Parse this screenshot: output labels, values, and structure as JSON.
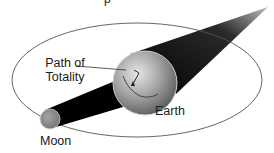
{
  "diagram": {
    "title_fragment": "p",
    "labels": {
      "path_of_totality": "Path of\nTotality",
      "path_line1": "Path of",
      "path_line2": "Totality",
      "earth": "Earth",
      "moon": "Moon"
    },
    "elements": {
      "orbit": {
        "shape": "ellipse",
        "cx": 137,
        "cy": 80,
        "rx": 125,
        "ry": 57,
        "stroke": "#555555"
      },
      "earth": {
        "shape": "sphere",
        "cx": 145,
        "cy": 83,
        "r": 32,
        "color": "#8a8a8a"
      },
      "moon": {
        "shape": "circle",
        "cx": 50,
        "cy": 119,
        "r": 10,
        "color": "#8c8c8c"
      },
      "umbra_shadow": {
        "from": "moon",
        "to": "earth",
        "color": "#000000"
      },
      "earth_shadow": {
        "from": "earth",
        "to_tip": [
          268,
          8
        ],
        "color": "#111111"
      }
    },
    "colors": {
      "background": "#ffffff",
      "shadow": "#000000",
      "orbit_line": "#555555",
      "text": "#1a1a1a"
    }
  }
}
